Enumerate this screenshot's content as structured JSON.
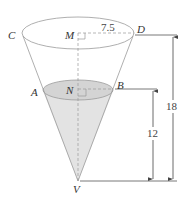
{
  "figure": {
    "type": "cone-with-water-level",
    "points": {
      "C": "C",
      "D": "D",
      "M": "M",
      "A": "A",
      "B": "B",
      "N": "N",
      "V": "V"
    },
    "dimensions": {
      "top_radius": "7.5",
      "total_height": "18",
      "water_height": "12"
    },
    "colors": {
      "stroke": "#8a8a8a",
      "water_fill": "#d9d9d9",
      "water_surface": "#cfcfcf",
      "dim_line": "#555555"
    }
  }
}
